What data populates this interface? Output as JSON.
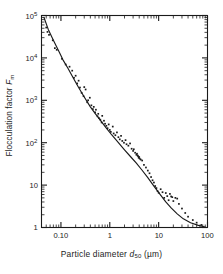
{
  "chart_data": {
    "type": "scatter",
    "title": "",
    "xlabel": "Particle diameter d50 (µm)",
    "ylabel": "Flocculation factor Fm",
    "xscale": "log",
    "yscale": "log",
    "xlim": [
      0.04,
      100
    ],
    "ylim": [
      1,
      100000
    ],
    "grid": false,
    "legend": null,
    "xticks": [
      {
        "value": 0.1,
        "label": "0.10"
      },
      {
        "value": 1,
        "label": "1"
      },
      {
        "value": 10,
        "label": "10"
      },
      {
        "value": 100,
        "label": "100"
      }
    ],
    "yticks": [
      {
        "value": 100000,
        "label": "10",
        "exponent": "5"
      },
      {
        "value": 10000,
        "label": "10",
        "exponent": "4"
      },
      {
        "value": 1000,
        "label": "10",
        "exponent": "3"
      },
      {
        "value": 100,
        "label": "10",
        "exponent": "2"
      },
      {
        "value": 10,
        "label": "10",
        "exponent": ""
      },
      {
        "value": 1,
        "label": "1",
        "exponent": ""
      }
    ],
    "series": [
      {
        "name": "measurements",
        "marker": "dot",
        "color": "#1a1a1a",
        "points": [
          [
            0.05,
            52000
          ],
          [
            0.053,
            41000
          ],
          [
            0.057,
            35000
          ],
          [
            0.068,
            26000
          ],
          [
            0.075,
            17000
          ],
          [
            0.082,
            15500
          ],
          [
            0.105,
            9500
          ],
          [
            0.125,
            7000
          ],
          [
            0.15,
            6200
          ],
          [
            0.17,
            5000
          ],
          [
            0.185,
            3400
          ],
          [
            0.2,
            3800
          ],
          [
            0.215,
            2500
          ],
          [
            0.23,
            2900
          ],
          [
            0.245,
            2000
          ],
          [
            0.265,
            1500
          ],
          [
            0.29,
            1250
          ],
          [
            0.3,
            2050
          ],
          [
            0.32,
            1800
          ],
          [
            0.345,
            900
          ],
          [
            0.36,
            1000
          ],
          [
            0.39,
            1150
          ],
          [
            0.42,
            760
          ],
          [
            0.45,
            620
          ],
          [
            0.47,
            700
          ],
          [
            0.5,
            520
          ],
          [
            0.52,
            600
          ],
          [
            0.56,
            420
          ],
          [
            0.58,
            480
          ],
          [
            0.6,
            380
          ],
          [
            0.64,
            350
          ],
          [
            0.68,
            300
          ],
          [
            0.7,
            430
          ],
          [
            0.76,
            330
          ],
          [
            0.8,
            280
          ],
          [
            0.85,
            250
          ],
          [
            0.9,
            220
          ],
          [
            0.95,
            270
          ],
          [
            1.0,
            200
          ],
          [
            1.05,
            180
          ],
          [
            1.15,
            240
          ],
          [
            1.2,
            165
          ],
          [
            1.3,
            150
          ],
          [
            1.4,
            175
          ],
          [
            1.5,
            135
          ],
          [
            1.6,
            120
          ],
          [
            1.7,
            145
          ],
          [
            1.8,
            110
          ],
          [
            1.95,
            100
          ],
          [
            2.1,
            115
          ],
          [
            2.2,
            92
          ],
          [
            2.4,
            85
          ],
          [
            2.6,
            96
          ],
          [
            2.8,
            72
          ],
          [
            3.0,
            64
          ],
          [
            3.1,
            70
          ],
          [
            3.3,
            58
          ],
          [
            3.5,
            52
          ],
          [
            3.6,
            55
          ],
          [
            3.7,
            50
          ],
          [
            3.8,
            48
          ],
          [
            3.9,
            44
          ],
          [
            4.0,
            46
          ],
          [
            4.1,
            42
          ],
          [
            4.3,
            40
          ],
          [
            4.6,
            38
          ],
          [
            5.0,
            30
          ],
          [
            5.5,
            26
          ],
          [
            6.0,
            22
          ],
          [
            6.5,
            19
          ],
          [
            7.0,
            15.5
          ],
          [
            7.5,
            13
          ],
          [
            8.0,
            11.5
          ],
          [
            8.5,
            9.5
          ],
          [
            9.0,
            8.5
          ],
          [
            9.5,
            7.2
          ],
          [
            10.0,
            6.6
          ],
          [
            11.0,
            8.0
          ],
          [
            12.0,
            6.8
          ],
          [
            13.0,
            5.0
          ],
          [
            14.0,
            6.5
          ],
          [
            15.0,
            5.5
          ],
          [
            16.0,
            4.4
          ],
          [
            17.0,
            6.2
          ],
          [
            18.0,
            5.4
          ],
          [
            19.0,
            5.2
          ],
          [
            20.0,
            4.2
          ],
          [
            22.0,
            5.0
          ],
          [
            24.0,
            4.8
          ],
          [
            26.0,
            3.6
          ],
          [
            30.0,
            2.8
          ],
          [
            35.0,
            2.2
          ],
          [
            40.0,
            1.8
          ],
          [
            50.0,
            1.5
          ],
          [
            60.0,
            1.3
          ],
          [
            75.0,
            1.15
          ]
        ]
      },
      {
        "name": "fitted curve",
        "marker": "line",
        "color": "#1a1a1a",
        "points": [
          [
            0.045,
            90000
          ],
          [
            0.055,
            47000
          ],
          [
            0.07,
            26000
          ],
          [
            0.09,
            14500
          ],
          [
            0.11,
            9000
          ],
          [
            0.14,
            5600
          ],
          [
            0.18,
            3300
          ],
          [
            0.23,
            2000
          ],
          [
            0.3,
            1200
          ],
          [
            0.4,
            700
          ],
          [
            0.5,
            490
          ],
          [
            0.65,
            330
          ],
          [
            0.85,
            220
          ],
          [
            1.1,
            152
          ],
          [
            1.5,
            100
          ],
          [
            2.0,
            68
          ],
          [
            2.7,
            46
          ],
          [
            3.5,
            33
          ],
          [
            4.5,
            23
          ],
          [
            6.0,
            15
          ],
          [
            8.0,
            9.5
          ],
          [
            10.5,
            6.2
          ],
          [
            14.0,
            4.0
          ],
          [
            18.0,
            2.9
          ],
          [
            24.0,
            2.1
          ],
          [
            32.0,
            1.6
          ],
          [
            45.0,
            1.3
          ],
          [
            65.0,
            1.12
          ],
          [
            90.0,
            1.03
          ]
        ]
      }
    ]
  },
  "axis_titles": {
    "y_prefix": "Flocculation factor ",
    "y_symbol": "F",
    "y_symbol_sub": "m",
    "x_prefix": "Particle diameter ",
    "x_symbol": "d",
    "x_symbol_sub": "50",
    "x_units": " (µm)"
  }
}
